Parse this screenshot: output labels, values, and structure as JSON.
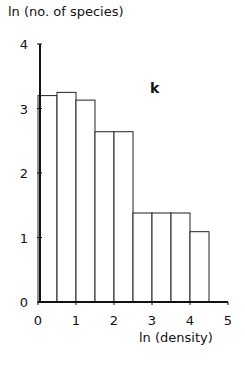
{
  "chart_data": {
    "type": "bar",
    "title": "",
    "panel_label": "k",
    "xlabel": "ln (density)",
    "ylabel": "ln (no. of species)",
    "xlim": [
      0,
      5
    ],
    "ylim": [
      0,
      4
    ],
    "x_ticks": [
      "0",
      "1",
      "2",
      "3",
      "4",
      "5"
    ],
    "y_ticks": [
      "0",
      "1",
      "2",
      "3",
      "4"
    ],
    "grid": false,
    "legend": null,
    "bin_width": 0.5,
    "categories": [
      "0-0.5",
      "0.5-1",
      "1-1.5",
      "1.5-2",
      "2-2.5",
      "2.5-3",
      "3-3.5",
      "3.5-4",
      "4-4.5"
    ],
    "bin_edges": [
      0,
      0.5,
      1,
      1.5,
      2,
      2.5,
      3,
      3.5,
      4,
      4.5
    ],
    "values": [
      3.2,
      3.25,
      3.13,
      2.64,
      2.64,
      1.38,
      1.38,
      1.38,
      1.09
    ]
  }
}
